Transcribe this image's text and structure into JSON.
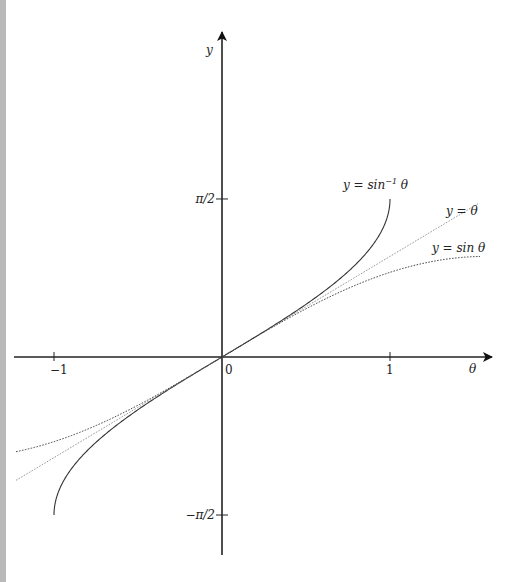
{
  "chart_data": {
    "type": "line",
    "title": "",
    "xlabel": "θ",
    "ylabel": "y",
    "xlim": [
      -1.226,
      1.536
    ],
    "ylim": [
      -1.95,
      3.2
    ],
    "grid": false,
    "x_ticks": [
      {
        "value": -1,
        "label": "−1"
      },
      {
        "value": 0,
        "label": "0"
      },
      {
        "value": 1,
        "label": "1"
      }
    ],
    "y_ticks": [
      {
        "value": 1.5708,
        "label": "π/2"
      },
      {
        "value": -1.5708,
        "label": "−π/2"
      }
    ],
    "series": [
      {
        "name": "y = sin⁻¹ θ",
        "function": "asin",
        "domain": [
          -1,
          1
        ],
        "style": "solid",
        "label_base": "y = sin",
        "label_sup": "−1",
        "label_tail": " θ"
      },
      {
        "name": "y = θ",
        "function": "identity",
        "domain": [
          -1.226,
          1.524
        ],
        "style": "dotted-light",
        "label_base": "y = θ",
        "label_sup": "",
        "label_tail": ""
      },
      {
        "name": "y = sin θ",
        "function": "sin",
        "domain": [
          -1.226,
          1.536
        ],
        "style": "dotted",
        "label_base": "y = sin θ",
        "label_sup": "",
        "label_tail": ""
      }
    ],
    "legend": "inline-labels-top-right"
  }
}
